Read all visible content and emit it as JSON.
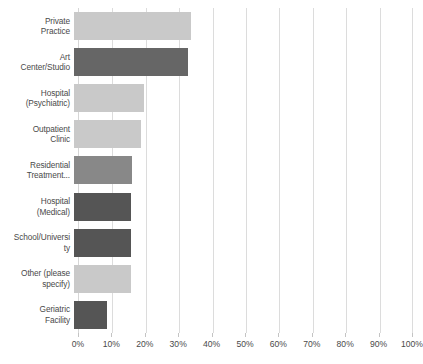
{
  "chart_data": {
    "type": "bar",
    "orientation": "horizontal",
    "title": "",
    "subtitle": "",
    "xlabel": "",
    "ylabel": "",
    "xlim": [
      0,
      100
    ],
    "xtick_labels": [
      "0%",
      "10%",
      "20%",
      "30%",
      "40%",
      "50%",
      "60%",
      "70%",
      "80%",
      "90%",
      "100%"
    ],
    "xticks": [
      0,
      10,
      20,
      30,
      40,
      50,
      60,
      70,
      80,
      90,
      100
    ],
    "grid": true,
    "legend": "none",
    "value_unit": "%",
    "categories": [
      "Private Practice",
      "Art Center/Studio",
      "Hospital (Psychiatric)",
      "Outpatient Clinic",
      "Residential Treatment...",
      "Hospital (Medical)",
      "School/University",
      "Other (please specify)",
      "Geriatric Facility"
    ],
    "values": [
      35,
      34,
      21,
      20,
      17.5,
      17,
      17,
      17,
      10
    ],
    "bar_colors": [
      "#c9c9c9",
      "#666666",
      "#c9c9c9",
      "#c9c9c9",
      "#888888",
      "#555555",
      "#555555",
      "#c9c9c9",
      "#555555"
    ],
    "bars": [
      {
        "label": "Private Practice",
        "label_lines": [
          "Private",
          "Practice"
        ],
        "value": 35,
        "tone": "light",
        "color": "#c9c9c9"
      },
      {
        "label": "Art Center/Studio",
        "label_lines": [
          "Art",
          "Center/Studio"
        ],
        "value": 34,
        "tone": "dark",
        "color": "#666666"
      },
      {
        "label": "Hospital (Psychiatric)",
        "label_lines": [
          "Hospital",
          "(Psychiatric)"
        ],
        "value": 21,
        "tone": "light",
        "color": "#c9c9c9"
      },
      {
        "label": "Outpatient Clinic",
        "label_lines": [
          "Outpatient",
          "Clinic"
        ],
        "value": 20,
        "tone": "light",
        "color": "#c9c9c9"
      },
      {
        "label": "Residential Treatment...",
        "label_lines": [
          "Residential",
          "Treatment..."
        ],
        "value": 17.5,
        "tone": "light",
        "color": "#888888"
      },
      {
        "label": "Hospital (Medical)",
        "label_lines": [
          "Hospital",
          "(Medical)"
        ],
        "value": 17,
        "tone": "dark",
        "color": "#555555"
      },
      {
        "label": "School/University",
        "label_lines": [
          "School/Universi",
          "ty"
        ],
        "value": 17,
        "tone": "dark",
        "color": "#555555"
      },
      {
        "label": "Other (please specify)",
        "label_lines": [
          "Other (please",
          "specify)"
        ],
        "value": 17,
        "tone": "light",
        "color": "#c9c9c9"
      },
      {
        "label": "Geriatric Facility",
        "label_lines": [
          "Geriatric",
          "Facility"
        ],
        "value": 10,
        "tone": "dark",
        "color": "#555555"
      }
    ]
  },
  "colors": {
    "light_bar": "#c9c9c9",
    "mid_bar": "#888888",
    "dark_bar": "#555555",
    "dark_bar_alt": "#666666",
    "gridline": "#dcdcdc",
    "text": "#4a4a4a",
    "background": "#ffffff"
  }
}
